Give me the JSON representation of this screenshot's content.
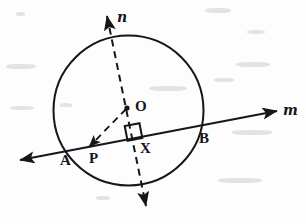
{
  "figure": {
    "background_color": "#fdfdfd",
    "ink_color": "#16161a",
    "stroke_width": 2,
    "canvas": {
      "width": 306,
      "height": 224
    }
  },
  "circle": {
    "name": "circle-O",
    "center_x": 128.5,
    "center_y": 110.5,
    "radius": 75,
    "style": "solid"
  },
  "lines": {
    "m": {
      "label": "m",
      "style": "solid",
      "description": "secant line through A and B",
      "x1": 20,
      "y1": 160,
      "x2": 277,
      "y2": 111,
      "arrow_start": true,
      "arrow_end": true,
      "label_x": 283,
      "label_y": 103
    },
    "n": {
      "label": "n",
      "style": "dashed",
      "description": "line perpendicular to m through center O",
      "x1": 107,
      "y1": 16,
      "x2": 146,
      "y2": 206,
      "arrow_start": true,
      "arrow_end": true,
      "label_x": 117,
      "label_y": 10
    },
    "op": {
      "label": "",
      "style": "dashed",
      "description": "segment from center O to point P with arrowhead at P",
      "x1": 126,
      "y1": 109,
      "x2": 89,
      "y2": 147,
      "arrow_start": false,
      "arrow_end": true
    }
  },
  "right_angle_marker": {
    "name": "right-angle-square",
    "at_x": 133.5,
    "at_y": 132,
    "size": 15,
    "description": "square marking 90 degrees between line n and line m at X"
  },
  "points": [
    {
      "name": "point-O",
      "label": "O",
      "x": 127,
      "y": 108,
      "label_x": 135,
      "label_y": 99,
      "marker": "arrow-dot"
    },
    {
      "name": "point-A",
      "label": "A",
      "x": 64,
      "y": 149,
      "label_x": 60,
      "label_y": 153,
      "marker": "none"
    },
    {
      "name": "point-P",
      "label": "P",
      "x": 89,
      "y": 147,
      "label_x": 89,
      "label_y": 151,
      "marker": "none"
    },
    {
      "name": "point-X",
      "label": "X",
      "x": 138,
      "y": 138,
      "label_x": 140,
      "label_y": 141,
      "marker": "none"
    },
    {
      "name": "point-B",
      "label": "B",
      "x": 200,
      "y": 128,
      "label_x": 199,
      "label_y": 131,
      "marker": "none"
    }
  ],
  "specks": [
    {
      "x": 16,
      "y": 12,
      "w": 9,
      "h": 4
    },
    {
      "x": 205,
      "y": 8,
      "w": 26,
      "h": 5
    },
    {
      "x": 247,
      "y": 30,
      "w": 18,
      "h": 4
    },
    {
      "x": 6,
      "y": 64,
      "w": 30,
      "h": 5
    },
    {
      "x": 236,
      "y": 62,
      "w": 34,
      "h": 5
    },
    {
      "x": 60,
      "y": 103,
      "w": 12,
      "h": 4
    },
    {
      "x": 214,
      "y": 78,
      "w": 20,
      "h": 4
    },
    {
      "x": 232,
      "y": 130,
      "w": 40,
      "h": 5
    },
    {
      "x": 10,
      "y": 106,
      "w": 24,
      "h": 4
    },
    {
      "x": 218,
      "y": 178,
      "w": 44,
      "h": 5
    },
    {
      "x": 149,
      "y": 86,
      "w": 38,
      "h": 5
    },
    {
      "x": 96,
      "y": 196,
      "w": 14,
      "h": 4
    }
  ]
}
